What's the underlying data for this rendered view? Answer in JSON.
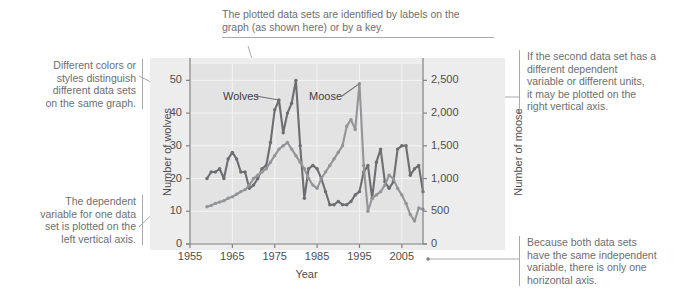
{
  "figure": {
    "annotations": [
      {
        "id": "labels-annotation",
        "text": "The plotted data sets are identified by labels on the\ngraph (as shown here) or by a key."
      },
      {
        "id": "colors-annotation",
        "text": "Different colors or\nstyles distinguish\ndifferent data sets\non the same graph."
      },
      {
        "id": "left-axis-annotation",
        "text": "The dependent\nvariable for one data\nset is plotted on the\nleft vertical axis."
      },
      {
        "id": "right-axis-annotation",
        "text": "If the second data set has a\ndifferent dependent\nvariable or different units,\nit may be plotted on the\nright vertical axis."
      },
      {
        "id": "horizontal-axis-annotation",
        "text": "Because both data sets\nhave the same independent\nvariable, there is only one\nhorizontal axis."
      }
    ],
    "colors": {
      "wolves_line": "#6d6e71",
      "moose_line": "#939598",
      "plot_background": "#e3e3e3",
      "outer_background": "#ededed",
      "axis": "#808285",
      "leader": "#a7a9ac",
      "annotation_text": "#6d6e71"
    }
  },
  "chart_data": {
    "type": "line",
    "title": "",
    "xlabel": "Year",
    "ylabel": "Number of wolves",
    "y2label": "Number of moose",
    "xlim": [
      1955,
      2010
    ],
    "ylim": [
      0,
      55
    ],
    "y2lim": [
      0,
      2750
    ],
    "xticks": [
      1955,
      1965,
      1975,
      1985,
      1995,
      2005
    ],
    "xticklabels": [
      "1955",
      "1965",
      "1975",
      "1985",
      "1995",
      "2005"
    ],
    "yticks": [
      0,
      10,
      20,
      30,
      40,
      50
    ],
    "yticklabels": [
      "0",
      "10",
      "20",
      "30",
      "40",
      "50"
    ],
    "y2ticks": [
      0,
      500,
      1000,
      1500,
      2000,
      2500
    ],
    "y2ticklabels": [
      "0",
      "500",
      "1,000",
      "1,500",
      "2,000",
      "2,500"
    ],
    "grid": true,
    "legend": "inline-labels",
    "series": [
      {
        "name": "Wolves",
        "axis": "left",
        "color": "#6d6e71",
        "x": [
          1959,
          1960,
          1961,
          1962,
          1963,
          1964,
          1965,
          1966,
          1967,
          1968,
          1969,
          1970,
          1971,
          1972,
          1973,
          1974,
          1975,
          1976,
          1977,
          1978,
          1979,
          1980,
          1981,
          1982,
          1983,
          1984,
          1985,
          1986,
          1987,
          1988,
          1989,
          1990,
          1991,
          1992,
          1993,
          1994,
          1995,
          1996,
          1997,
          1998,
          1999,
          2000,
          2001,
          2002,
          2003,
          2004,
          2005,
          2006,
          2007,
          2008,
          2009,
          2010
        ],
        "values": [
          20,
          22,
          22,
          23,
          20,
          26,
          28,
          26,
          22,
          22,
          17,
          18,
          20,
          23,
          24,
          31,
          41,
          44,
          34,
          40,
          43,
          50,
          30,
          14,
          23,
          24,
          23,
          20,
          16,
          12,
          12,
          13,
          12,
          12,
          13,
          15,
          16,
          22,
          24,
          14,
          25,
          29,
          19,
          17,
          19,
          29,
          30,
          30,
          21,
          23,
          24,
          16
        ]
      },
      {
        "name": "Moose",
        "axis": "right",
        "color": "#939598",
        "x": [
          1959,
          1960,
          1961,
          1962,
          1963,
          1964,
          1965,
          1966,
          1967,
          1968,
          1969,
          1970,
          1971,
          1972,
          1973,
          1974,
          1975,
          1976,
          1977,
          1978,
          1979,
          1980,
          1981,
          1982,
          1983,
          1984,
          1985,
          1986,
          1987,
          1988,
          1989,
          1990,
          1991,
          1992,
          1993,
          1994,
          1995,
          1996,
          1997,
          1998,
          1999,
          2000,
          2001,
          2002,
          2003,
          2004,
          2005,
          2006,
          2007,
          2008,
          2009,
          2010
        ],
        "values": [
          570,
          590,
          620,
          640,
          660,
          700,
          720,
          760,
          800,
          830,
          900,
          1000,
          1050,
          1100,
          1150,
          1250,
          1350,
          1450,
          1500,
          1550,
          1450,
          1350,
          1250,
          1150,
          1000,
          900,
          850,
          1000,
          1100,
          1200,
          1300,
          1400,
          1500,
          1800,
          1900,
          1750,
          2450,
          1200,
          500,
          700,
          750,
          800,
          900,
          1050,
          1000,
          850,
          750,
          620,
          450,
          350,
          550,
          530
        ]
      }
    ]
  }
}
